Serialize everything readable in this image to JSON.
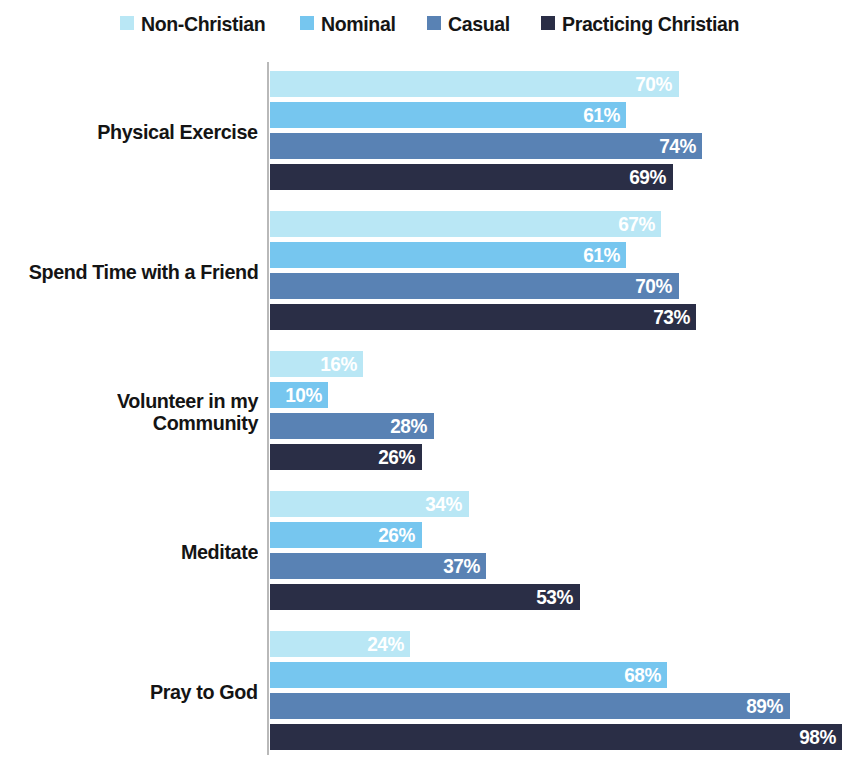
{
  "legend": {
    "position": "top-center",
    "items": [
      {
        "label": "Non-Christian",
        "color": "#b9e7f5"
      },
      {
        "label": "Nominal",
        "color": "#76c6ef"
      },
      {
        "label": "Casual",
        "color": "#5982b4"
      },
      {
        "label": "Practicing Christian",
        "color": "#2a2e46"
      }
    ]
  },
  "chart_data": {
    "type": "bar",
    "orientation": "horizontal",
    "title": "",
    "subtitle": "",
    "xlabel": "",
    "ylabel": "",
    "xlim": [
      0,
      100
    ],
    "grid": false,
    "value_suffix": "%",
    "legend_position": "top-center",
    "categories": [
      "Physical Exercise",
      "Spend Time with a Friend",
      "Volunteer in my Community",
      "Meditate",
      "Pray to God"
    ],
    "series": [
      {
        "name": "Non-Christian",
        "color": "#b9e7f5",
        "values": [
          70,
          67,
          16,
          34,
          24
        ],
        "labels": [
          "70%",
          "67%",
          "16%",
          "34%",
          "24%"
        ]
      },
      {
        "name": "Nominal",
        "color": "#76c6ef",
        "values": [
          61,
          61,
          10,
          26,
          68
        ],
        "labels": [
          "61%",
          "61%",
          "10%",
          "26%",
          "68%"
        ]
      },
      {
        "name": "Casual",
        "color": "#5982b4",
        "values": [
          74,
          70,
          28,
          37,
          89
        ],
        "labels": [
          "74%",
          "70%",
          "28%",
          "37%",
          "89%"
        ]
      },
      {
        "name": "Practicing Christian",
        "color": "#2a2e46",
        "values": [
          69,
          73,
          26,
          53,
          98
        ],
        "labels": [
          "69%",
          "73%",
          "26%",
          "53%",
          "98%"
        ]
      }
    ]
  }
}
